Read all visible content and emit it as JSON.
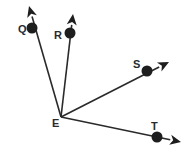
{
  "diagram": {
    "type": "rays-from-common-vertex",
    "vertex": {
      "label": "E",
      "x": 61,
      "y": 117,
      "label_x": 52,
      "label_y": 127
    },
    "rays": [
      {
        "name": "Q",
        "label": "Q",
        "point": {
          "x": 32,
          "y": 28
        },
        "tip": {
          "x": 29,
          "y": 6
        },
        "label_x": 18,
        "label_y": 33
      },
      {
        "name": "R",
        "label": "R",
        "point": {
          "x": 70,
          "y": 33
        },
        "tip": {
          "x": 73,
          "y": 14
        },
        "label_x": 54,
        "label_y": 39
      },
      {
        "name": "S",
        "label": "S",
        "point": {
          "x": 147,
          "y": 71
        },
        "tip": {
          "x": 169,
          "y": 62
        },
        "label_x": 133,
        "label_y": 68
      },
      {
        "name": "T",
        "label": "T",
        "point": {
          "x": 157,
          "y": 137
        },
        "tip": {
          "x": 181,
          "y": 142
        },
        "label_x": 151,
        "label_y": 130
      }
    ],
    "colors": {
      "stroke": "#2a2a2a",
      "fill": "#1e1e1e",
      "background": "#ffffff"
    }
  }
}
